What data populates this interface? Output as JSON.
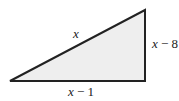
{
  "diagram": {
    "type": "right-triangle",
    "fill_color": "#eeeeee",
    "stroke_color": "#222222",
    "vertices": {
      "bottom_left": [
        10,
        81
      ],
      "bottom_right": [
        145,
        81
      ],
      "top_right": [
        145,
        10
      ]
    },
    "labels": {
      "hypotenuse": {
        "var": "x",
        "rest": ""
      },
      "vertical_leg": {
        "var": "x",
        "rest": " − 8"
      },
      "horizontal_leg": {
        "var": "x",
        "rest": " − 1"
      }
    }
  }
}
